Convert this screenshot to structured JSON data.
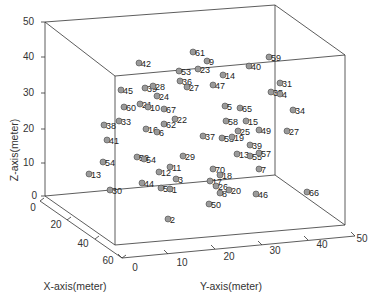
{
  "chart_data": {
    "type": "scatter",
    "subtype": "3d-scatter",
    "title": "",
    "xlabel": "X-axis(meter)",
    "ylabel": "Y-axis(meter)",
    "zlabel": "Z-axis(meter)",
    "xlim": [
      0,
      60
    ],
    "ylim": [
      0,
      50
    ],
    "zlim": [
      0,
      50
    ],
    "x_ticks": [
      "0",
      "20",
      "40",
      "60"
    ],
    "y_ticks": [
      "0",
      "10",
      "20",
      "30",
      "40",
      "50"
    ],
    "z_ticks": [
      "0",
      "10",
      "20",
      "30",
      "40",
      "50"
    ],
    "grid": false,
    "legend": null,
    "marker_color": "#9a9a9a",
    "points_screen": [
      {
        "id": "61",
        "sx": 193,
        "sy": 52
      },
      {
        "id": "9",
        "sx": 207,
        "sy": 61
      },
      {
        "id": "59",
        "sx": 269,
        "sy": 57
      },
      {
        "id": "42",
        "sx": 139,
        "sy": 63
      },
      {
        "id": "53",
        "sx": 179,
        "sy": 71
      },
      {
        "id": "23",
        "sx": 198,
        "sy": 69
      },
      {
        "id": "40",
        "sx": 249,
        "sy": 66
      },
      {
        "id": "14",
        "sx": 223,
        "sy": 75
      },
      {
        "id": "47",
        "sx": 213,
        "sy": 85
      },
      {
        "id": "36",
        "sx": 180,
        "sy": 81
      },
      {
        "id": "27",
        "sx": 187,
        "sy": 87
      },
      {
        "id": "31",
        "sx": 280,
        "sy": 83
      },
      {
        "id": "35",
        "sx": 271,
        "sy": 92
      },
      {
        "id": "4",
        "sx": 280,
        "sy": 94
      },
      {
        "id": "45",
        "sx": 121,
        "sy": 90
      },
      {
        "id": "39",
        "sx": 145,
        "sy": 88
      },
      {
        "id": "28",
        "sx": 153,
        "sy": 86
      },
      {
        "id": "24",
        "sx": 157,
        "sy": 96
      },
      {
        "id": "34",
        "sx": 293,
        "sy": 110
      },
      {
        "id": "60",
        "sx": 124,
        "sy": 107
      },
      {
        "id": "21",
        "sx": 140,
        "sy": 104
      },
      {
        "id": "10",
        "sx": 148,
        "sy": 107
      },
      {
        "id": "67",
        "sx": 164,
        "sy": 109
      },
      {
        "id": "5",
        "sx": 225,
        "sy": 106
      },
      {
        "id": "65",
        "sx": 240,
        "sy": 108
      },
      {
        "id": "33",
        "sx": 119,
        "sy": 121
      },
      {
        "id": "38",
        "sx": 104,
        "sy": 125
      },
      {
        "id": "62",
        "sx": 164,
        "sy": 124
      },
      {
        "id": "22",
        "sx": 175,
        "sy": 119
      },
      {
        "id": "58",
        "sx": 226,
        "sy": 121
      },
      {
        "id": "15",
        "sx": 246,
        "sy": 121
      },
      {
        "id": "16",
        "sx": 146,
        "sy": 129
      },
      {
        "id": "6",
        "sx": 157,
        "sy": 132
      },
      {
        "id": "25",
        "sx": 238,
        "sy": 131
      },
      {
        "id": "49",
        "sx": 259,
        "sy": 130
      },
      {
        "id": "27b",
        "sx": 287,
        "sy": 131
      },
      {
        "id": "41",
        "sx": 107,
        "sy": 140
      },
      {
        "id": "37",
        "sx": 203,
        "sy": 136
      },
      {
        "id": "53b",
        "sx": 222,
        "sy": 138
      },
      {
        "id": "19",
        "sx": 232,
        "sy": 137
      },
      {
        "id": "39b",
        "sx": 250,
        "sy": 145
      },
      {
        "id": "13",
        "sx": 237,
        "sy": 154
      },
      {
        "id": "55",
        "sx": 250,
        "sy": 156
      },
      {
        "id": "57",
        "sx": 259,
        "sy": 153
      },
      {
        "id": "52",
        "sx": 137,
        "sy": 157
      },
      {
        "id": "54",
        "sx": 144,
        "sy": 159
      },
      {
        "id": "29",
        "sx": 183,
        "sy": 156
      },
      {
        "id": "54b",
        "sx": 103,
        "sy": 162
      },
      {
        "id": "13b",
        "sx": 89,
        "sy": 174
      },
      {
        "id": "70",
        "sx": 213,
        "sy": 169
      },
      {
        "id": "7",
        "sx": 259,
        "sy": 169
      },
      {
        "id": "11",
        "sx": 170,
        "sy": 167
      },
      {
        "id": "12",
        "sx": 159,
        "sy": 172
      },
      {
        "id": "18",
        "sx": 220,
        "sy": 175
      },
      {
        "id": "3",
        "sx": 176,
        "sy": 179
      },
      {
        "id": "44",
        "sx": 142,
        "sy": 183
      },
      {
        "id": "17",
        "sx": 210,
        "sy": 181
      },
      {
        "id": "26",
        "sx": 216,
        "sy": 186
      },
      {
        "id": "51",
        "sx": 161,
        "sy": 188
      },
      {
        "id": "1",
        "sx": 170,
        "sy": 189
      },
      {
        "id": "30",
        "sx": 110,
        "sy": 190
      },
      {
        "id": "20",
        "sx": 229,
        "sy": 190
      },
      {
        "id": "8",
        "sx": 220,
        "sy": 193
      },
      {
        "id": "46",
        "sx": 256,
        "sy": 194
      },
      {
        "id": "66",
        "sx": 307,
        "sy": 192
      },
      {
        "id": "50",
        "sx": 209,
        "sy": 204
      },
      {
        "id": "2",
        "sx": 168,
        "sy": 219
      }
    ]
  },
  "axes": {
    "z_ticks": [
      {
        "label": "50",
        "x": 34,
        "y": 25
      },
      {
        "label": "40",
        "x": 34,
        "y": 60
      },
      {
        "label": "30",
        "x": 34,
        "y": 96
      },
      {
        "label": "20",
        "x": 34,
        "y": 132
      },
      {
        "label": "10",
        "x": 34,
        "y": 166
      },
      {
        "label": "0",
        "x": 37,
        "y": 199
      }
    ],
    "x_ticks": [
      {
        "label": "0",
        "x": 33,
        "y": 211
      },
      {
        "label": "20",
        "x": 56,
        "y": 228
      },
      {
        "label": "40",
        "x": 83,
        "y": 247
      },
      {
        "label": "60",
        "x": 108,
        "y": 264
      }
    ],
    "y_ticks": [
      {
        "label": "0",
        "x": 135,
        "y": 271
      },
      {
        "label": "10",
        "x": 182,
        "y": 266
      },
      {
        "label": "20",
        "x": 229,
        "y": 260
      },
      {
        "label": "30",
        "x": 275,
        "y": 254
      },
      {
        "label": "40",
        "x": 322,
        "y": 248
      },
      {
        "label": "50",
        "x": 362,
        "y": 242
      }
    ],
    "xlabel": "X-axis(meter)",
    "ylabel": "Y-axis(meter)",
    "zlabel": "Z-axis(meter)"
  }
}
